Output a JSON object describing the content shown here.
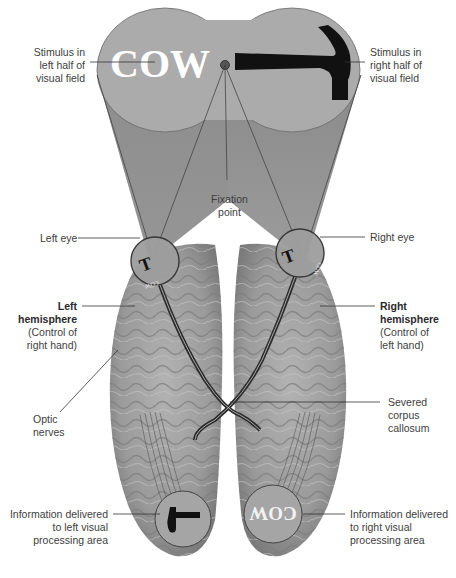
{
  "figure": {
    "type": "split-brain visual pathway diagram",
    "stimuli": {
      "left_word": "COW",
      "right_object": "hammer",
      "fixation_dot": true
    },
    "labels": {
      "stimulus_left": [
        "Stimulus in",
        "left half of",
        "visual field"
      ],
      "stimulus_right": [
        "Stimulus in",
        "right half of",
        "visual field"
      ],
      "fixation": [
        "Fixation",
        "point"
      ],
      "left_eye": "Left eye",
      "right_eye": "Right eye",
      "left_hemisphere_title": [
        "Left",
        "hemisphere"
      ],
      "left_hemisphere_note": [
        "(Control of",
        "right hand)"
      ],
      "right_hemisphere_title": [
        "Right",
        "hemisphere"
      ],
      "right_hemisphere_note": [
        "(Control of",
        "left hand)"
      ],
      "optic_nerves": [
        "Optic",
        "nerves"
      ],
      "corpus_callosum": [
        "Severed",
        "corpus",
        "callosum"
      ],
      "info_left": [
        "Information delivered",
        "to left visual",
        "processing area"
      ],
      "info_right": [
        "Information delivered",
        "to right visual",
        "processing area"
      ]
    },
    "colors": {
      "field_fill": "#a9a9a9",
      "cone_fill": "#8d8d8d",
      "brain_fill": "#9a9a9a",
      "brain_dark": "#6e6e6e",
      "nerve": "#2b2b2b",
      "stimulus_text": "#ffffff",
      "hammer": "#111111"
    }
  }
}
